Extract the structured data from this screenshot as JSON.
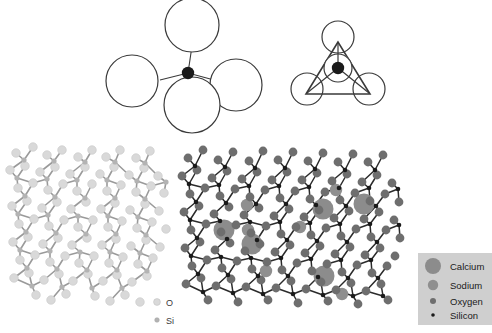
{
  "figure": {
    "type": "scientific-diagram",
    "width": 492,
    "height": 333,
    "background": "#ffffff"
  },
  "colors": {
    "outline": "#3a3a3a",
    "silicon_black": "#1a1a1a",
    "oxygen_dark": "#6e6e6e",
    "oxygen_light": "#d9d9d9",
    "silicon_light": "#b3b3b3",
    "bond_light": "#9a9a9a",
    "bond_dark": "#2b2b2b",
    "calcium": "#8c8c8c",
    "sodium": "#8f8f8f",
    "legend_background": "#cfcfcf",
    "legend_text": "#1a1a1a"
  },
  "panels": {
    "tetrahedron_perspective": {
      "name": "SiO4 tetrahedron perspective view",
      "center_atom": "Silicon",
      "corner_atoms": "Oxygen",
      "corner_count": 4,
      "style": "open circles with outline"
    },
    "tetrahedron_plan": {
      "name": "SiO4 tetrahedron plan view",
      "center_atom": "Silicon",
      "corner_atoms": "Oxygen",
      "corner_count": 3,
      "style": "triangle with circles at vertices and centre"
    },
    "silica_network": {
      "name": "Pure silica glass network",
      "tone": "light",
      "inline_legend": [
        {
          "symbol": "O",
          "kind": "oxygen"
        },
        {
          "symbol": "Si",
          "kind": "silicon"
        }
      ]
    },
    "soda_lime_network": {
      "name": "Soda-lime silicate glass network with network modifiers",
      "tone": "dark",
      "modifiers": [
        "Calcium",
        "Sodium"
      ]
    }
  },
  "legend": {
    "items": [
      {
        "label": "Calcium",
        "radius": 8.0,
        "color": "#8c8c8c"
      },
      {
        "label": "Sodium",
        "radius": 5.2,
        "color": "#8f8f8f"
      },
      {
        "label": "Oxygen",
        "radius": 3.0,
        "color": "#6e6e6e"
      },
      {
        "label": "Silicon",
        "radius": 1.8,
        "color": "#1a1a1a"
      }
    ]
  },
  "chart_data": {
    "type": "scatter",
    "xlabel": "",
    "ylabel": "",
    "silica_network_nodes": {
      "oxygen": [
        [
          16,
          153
        ],
        [
          33,
          147
        ],
        [
          47,
          155
        ],
        [
          62,
          150
        ],
        [
          78,
          157
        ],
        [
          92,
          150
        ],
        [
          106,
          157
        ],
        [
          120,
          150
        ],
        [
          136,
          158
        ],
        [
          150,
          151
        ],
        [
          10,
          170
        ],
        [
          25,
          166
        ],
        [
          40,
          172
        ],
        [
          55,
          167
        ],
        [
          70,
          174
        ],
        [
          85,
          167
        ],
        [
          100,
          174
        ],
        [
          114,
          167
        ],
        [
          129,
          175
        ],
        [
          144,
          168
        ],
        [
          158,
          176
        ],
        [
          18,
          188
        ],
        [
          33,
          183
        ],
        [
          48,
          190
        ],
        [
          63,
          184
        ],
        [
          77,
          191
        ],
        [
          92,
          184
        ],
        [
          107,
          191
        ],
        [
          121,
          185
        ],
        [
          136,
          192
        ],
        [
          151,
          186
        ],
        [
          164,
          193
        ],
        [
          12,
          206
        ],
        [
          27,
          201
        ],
        [
          42,
          208
        ],
        [
          57,
          202
        ],
        [
          71,
          209
        ],
        [
          86,
          202
        ],
        [
          101,
          209
        ],
        [
          115,
          203
        ],
        [
          130,
          210
        ],
        [
          145,
          204
        ],
        [
          159,
          211
        ],
        [
          19,
          224
        ],
        [
          34,
          219
        ],
        [
          49,
          226
        ],
        [
          64,
          220
        ],
        [
          78,
          227
        ],
        [
          93,
          220
        ],
        [
          108,
          227
        ],
        [
          122,
          221
        ],
        [
          137,
          228
        ],
        [
          152,
          222
        ],
        [
          166,
          229
        ],
        [
          13,
          242
        ],
        [
          28,
          237
        ],
        [
          43,
          244
        ],
        [
          58,
          238
        ],
        [
          72,
          245
        ],
        [
          87,
          238
        ],
        [
          102,
          245
        ],
        [
          116,
          239
        ],
        [
          131,
          246
        ],
        [
          146,
          240
        ],
        [
          160,
          247
        ],
        [
          20,
          260
        ],
        [
          35,
          255
        ],
        [
          50,
          262
        ],
        [
          65,
          256
        ],
        [
          79,
          263
        ],
        [
          94,
          256
        ],
        [
          109,
          263
        ],
        [
          123,
          257
        ],
        [
          138,
          264
        ],
        [
          153,
          258
        ],
        [
          14,
          278
        ],
        [
          29,
          273
        ],
        [
          44,
          280
        ],
        [
          59,
          274
        ],
        [
          73,
          281
        ],
        [
          88,
          274
        ],
        [
          103,
          281
        ],
        [
          117,
          275
        ],
        [
          132,
          282
        ],
        [
          147,
          276
        ],
        [
          36,
          295
        ],
        [
          51,
          300
        ],
        [
          66,
          294
        ],
        [
          95,
          296
        ],
        [
          110,
          301
        ],
        [
          125,
          295
        ],
        [
          140,
          302
        ]
      ],
      "silicon": [
        [
          24,
          160
        ],
        [
          54,
          161
        ],
        [
          85,
          162
        ],
        [
          115,
          162
        ],
        [
          145,
          163
        ],
        [
          17,
          178
        ],
        [
          47,
          179
        ],
        [
          77,
          180
        ],
        [
          107,
          180
        ],
        [
          137,
          181
        ],
        [
          166,
          182
        ],
        [
          25,
          196
        ],
        [
          55,
          197
        ],
        [
          85,
          198
        ],
        [
          115,
          198
        ],
        [
          145,
          199
        ],
        [
          18,
          214
        ],
        [
          48,
          215
        ],
        [
          78,
          216
        ],
        [
          108,
          216
        ],
        [
          138,
          217
        ],
        [
          26,
          232
        ],
        [
          56,
          233
        ],
        [
          86,
          234
        ],
        [
          116,
          234
        ],
        [
          146,
          235
        ],
        [
          20,
          250
        ],
        [
          50,
          251
        ],
        [
          80,
          252
        ],
        [
          110,
          252
        ],
        [
          140,
          253
        ],
        [
          27,
          268
        ],
        [
          57,
          269
        ],
        [
          87,
          270
        ],
        [
          117,
          270
        ],
        [
          147,
          271
        ],
        [
          32,
          286
        ],
        [
          62,
          287
        ],
        [
          92,
          288
        ],
        [
          122,
          288
        ]
      ]
    },
    "soda_lime_network_nodes": {
      "oxygen": [
        [
          188,
          158
        ],
        [
          203,
          150
        ],
        [
          218,
          160
        ],
        [
          233,
          152
        ],
        [
          249,
          161
        ],
        [
          263,
          151
        ],
        [
          278,
          160
        ],
        [
          293,
          152
        ],
        [
          308,
          161
        ],
        [
          323,
          153
        ],
        [
          338,
          162
        ],
        [
          353,
          154
        ],
        [
          368,
          162
        ],
        [
          383,
          155
        ],
        [
          182,
          176
        ],
        [
          197,
          170
        ],
        [
          212,
          178
        ],
        [
          227,
          171
        ],
        [
          242,
          179
        ],
        [
          257,
          172
        ],
        [
          272,
          180
        ],
        [
          287,
          172
        ],
        [
          302,
          180
        ],
        [
          317,
          173
        ],
        [
          332,
          181
        ],
        [
          347,
          174
        ],
        [
          362,
          182
        ],
        [
          377,
          175
        ],
        [
          392,
          183
        ],
        [
          190,
          194
        ],
        [
          205,
          188
        ],
        [
          220,
          196
        ],
        [
          235,
          189
        ],
        [
          250,
          197
        ],
        [
          265,
          190
        ],
        [
          280,
          198
        ],
        [
          295,
          191
        ],
        [
          310,
          199
        ],
        [
          325,
          192
        ],
        [
          340,
          200
        ],
        [
          355,
          193
        ],
        [
          370,
          201
        ],
        [
          385,
          194
        ],
        [
          399,
          202
        ],
        [
          184,
          212
        ],
        [
          199,
          206
        ],
        [
          214,
          214
        ],
        [
          229,
          207
        ],
        [
          244,
          215
        ],
        [
          259,
          208
        ],
        [
          274,
          216
        ],
        [
          289,
          209
        ],
        [
          304,
          217
        ],
        [
          319,
          210
        ],
        [
          334,
          218
        ],
        [
          349,
          211
        ],
        [
          364,
          219
        ],
        [
          379,
          212
        ],
        [
          394,
          220
        ],
        [
          191,
          230
        ],
        [
          206,
          224
        ],
        [
          221,
          232
        ],
        [
          236,
          225
        ],
        [
          251,
          233
        ],
        [
          266,
          226
        ],
        [
          281,
          234
        ],
        [
          296,
          227
        ],
        [
          311,
          235
        ],
        [
          326,
          228
        ],
        [
          341,
          236
        ],
        [
          356,
          229
        ],
        [
          371,
          237
        ],
        [
          386,
          230
        ],
        [
          400,
          238
        ],
        [
          185,
          248
        ],
        [
          200,
          242
        ],
        [
          215,
          250
        ],
        [
          230,
          243
        ],
        [
          245,
          251
        ],
        [
          260,
          244
        ],
        [
          275,
          252
        ],
        [
          290,
          245
        ],
        [
          305,
          253
        ],
        [
          320,
          246
        ],
        [
          335,
          254
        ],
        [
          350,
          247
        ],
        [
          365,
          255
        ],
        [
          380,
          248
        ],
        [
          395,
          256
        ],
        [
          192,
          266
        ],
        [
          207,
          260
        ],
        [
          222,
          268
        ],
        [
          237,
          261
        ],
        [
          252,
          269
        ],
        [
          267,
          262
        ],
        [
          282,
          270
        ],
        [
          297,
          263
        ],
        [
          312,
          271
        ],
        [
          327,
          264
        ],
        [
          342,
          272
        ],
        [
          357,
          265
        ],
        [
          372,
          273
        ],
        [
          387,
          266
        ],
        [
          186,
          284
        ],
        [
          201,
          278
        ],
        [
          216,
          286
        ],
        [
          231,
          279
        ],
        [
          246,
          287
        ],
        [
          261,
          280
        ],
        [
          276,
          288
        ],
        [
          291,
          281
        ],
        [
          306,
          289
        ],
        [
          321,
          282
        ],
        [
          336,
          290
        ],
        [
          351,
          283
        ],
        [
          366,
          291
        ],
        [
          381,
          284
        ],
        [
          208,
          300
        ],
        [
          238,
          302
        ],
        [
          268,
          300
        ],
        [
          298,
          303
        ],
        [
          328,
          301
        ],
        [
          358,
          304
        ],
        [
          388,
          300
        ]
      ],
      "silicon": [
        [
          195,
          166
        ],
        [
          225,
          167
        ],
        [
          255,
          168
        ],
        [
          285,
          168
        ],
        [
          315,
          169
        ],
        [
          345,
          170
        ],
        [
          375,
          170
        ],
        [
          189,
          184
        ],
        [
          219,
          185
        ],
        [
          249,
          186
        ],
        [
          279,
          186
        ],
        [
          309,
          187
        ],
        [
          339,
          188
        ],
        [
          369,
          188
        ],
        [
          398,
          189
        ],
        [
          196,
          202
        ],
        [
          226,
          203
        ],
        [
          256,
          204
        ],
        [
          286,
          204
        ],
        [
          316,
          205
        ],
        [
          346,
          206
        ],
        [
          376,
          206
        ],
        [
          190,
          220
        ],
        [
          220,
          221
        ],
        [
          250,
          222
        ],
        [
          280,
          222
        ],
        [
          310,
          223
        ],
        [
          340,
          224
        ],
        [
          370,
          224
        ],
        [
          399,
          225
        ],
        [
          197,
          238
        ],
        [
          227,
          239
        ],
        [
          257,
          240
        ],
        [
          287,
          240
        ],
        [
          317,
          241
        ],
        [
          347,
          242
        ],
        [
          377,
          242
        ],
        [
          191,
          256
        ],
        [
          221,
          257
        ],
        [
          251,
          258
        ],
        [
          281,
          258
        ],
        [
          311,
          259
        ],
        [
          341,
          260
        ],
        [
          371,
          260
        ],
        [
          198,
          274
        ],
        [
          228,
          275
        ],
        [
          258,
          276
        ],
        [
          288,
          276
        ],
        [
          318,
          277
        ],
        [
          348,
          278
        ],
        [
          378,
          278
        ],
        [
          203,
          292
        ],
        [
          233,
          293
        ],
        [
          263,
          294
        ],
        [
          293,
          294
        ],
        [
          323,
          295
        ],
        [
          353,
          296
        ],
        [
          383,
          296
        ]
      ],
      "calcium": [
        [
          224,
          230
        ],
        [
          323,
          209
        ],
        [
          364,
          204
        ],
        [
          252,
          244
        ],
        [
          324,
          276
        ]
      ],
      "sodium": [
        [
          247,
          205
        ],
        [
          248,
          230
        ],
        [
          336,
          190
        ],
        [
          300,
          227
        ],
        [
          266,
          271
        ],
        [
          342,
          294
        ]
      ]
    }
  }
}
